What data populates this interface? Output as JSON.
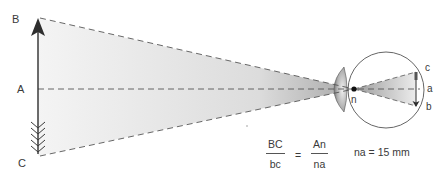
{
  "diagram": {
    "type": "visual-angle-optics",
    "object_points": {
      "top": "B",
      "middle": "A",
      "bottom": "C"
    },
    "image_points": {
      "top": "c",
      "middle": "a",
      "bottom": "b"
    },
    "nodal_point": "n",
    "formula": {
      "left_numerator": "BC",
      "left_denominator": "bc",
      "equals": "=",
      "right_numerator": "An",
      "right_denominator": "na"
    },
    "note": "na = 15 mm",
    "colors": {
      "line": "#3a3a3a",
      "dash": "#555555",
      "cone_dark": "#b8b8b8",
      "cone_light": "#f2f2f2",
      "lens": "#9a9a9a"
    }
  }
}
